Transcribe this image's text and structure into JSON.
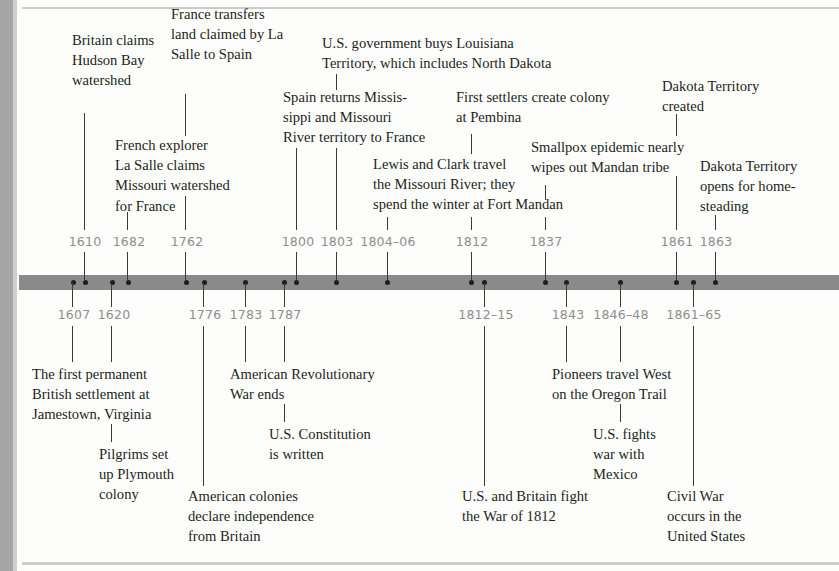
{
  "colors": {
    "bar": "#8a8a8a",
    "dot": "#1e1e1e",
    "year_text": "#8e8e8e",
    "label_text": "#231f20",
    "background": "#fdfdfc"
  },
  "events_above": [
    {
      "year": "1610",
      "lines": [
        "Britain claims",
        "Hudson Bay",
        "watershed"
      ]
    },
    {
      "year": "1682",
      "lines": [
        "French explorer",
        "La Salle claims",
        "Missouri watershed",
        "for France"
      ]
    },
    {
      "year": "1762",
      "lines": [
        "France transfers",
        "land claimed by La",
        "Salle to Spain"
      ]
    },
    {
      "year": "1800",
      "lines": [
        "Spain returns Missis-",
        "sippi and Missouri",
        "River territory to France"
      ]
    },
    {
      "year": "1803",
      "lines": [
        "U.S. government buys Louisiana",
        "Territory, which includes North Dakota"
      ]
    },
    {
      "year": "1804–06",
      "lines": [
        "Lewis and Clark travel",
        "the Missouri River; they",
        "spend the winter at Fort Mandan"
      ]
    },
    {
      "year": "1812",
      "lines": [
        "First settlers create colony",
        "at Pembina"
      ]
    },
    {
      "year": "1837",
      "lines": [
        "Smallpox epidemic nearly",
        "wipes out Mandan tribe"
      ]
    },
    {
      "year": "1861",
      "lines": [
        "Dakota Territory",
        "created"
      ]
    },
    {
      "year": "1863",
      "lines": [
        "Dakota Territory",
        "opens for home-",
        "steading"
      ]
    }
  ],
  "events_below": [
    {
      "year": "1607",
      "lines": [
        "The first permanent",
        "British settlement at",
        "Jamestown, Virginia"
      ]
    },
    {
      "year": "1620",
      "lines": [
        "Pilgrims set",
        "up Plymouth",
        "colony"
      ]
    },
    {
      "year": "1776",
      "lines": [
        "American colonies",
        "declare independence",
        "from Britain"
      ]
    },
    {
      "year": "1783",
      "lines": [
        "American Revolutionary",
        "War ends"
      ]
    },
    {
      "year": "1787",
      "lines": [
        "U.S. Constitution",
        "is written"
      ]
    },
    {
      "year": "1812–15",
      "lines": [
        "U.S. and Britain fight",
        "the War of 1812"
      ]
    },
    {
      "year": "1843",
      "lines": [
        "Pioneers travel West",
        "on the Oregon Trail"
      ]
    },
    {
      "year": "1846–48",
      "lines": [
        "U.S. fights",
        "war with",
        "Mexico"
      ]
    },
    {
      "year": "1861–65",
      "lines": [
        "Civil War",
        "occurs in the",
        "United States"
      ]
    }
  ]
}
